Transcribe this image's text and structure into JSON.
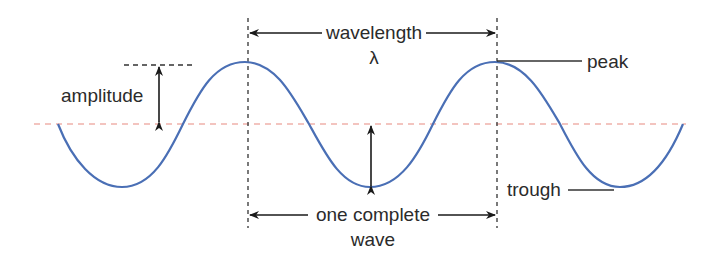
{
  "diagram": {
    "labels": {
      "wavelength": "wavelength",
      "lambda": "λ",
      "amplitude": "amplitude",
      "peak": "peak",
      "trough": "trough",
      "one_complete": "one complete",
      "wave": "wave"
    },
    "colors": {
      "wave": "#4a6fb5",
      "midline": "#e88a80",
      "annotation": "#1a1a1a",
      "guide": "#333333",
      "text": "#2b2b2b",
      "background": "#ffffff"
    },
    "geometry": {
      "midline_y": 124,
      "peak_y": 62,
      "trough_y": 187,
      "wave_start_x": 58,
      "wave_end_x": 683,
      "peaks_x": [
        245,
        495
      ],
      "troughs_x": [
        122,
        370,
        620
      ],
      "wavelength_markers_x": [
        248,
        497
      ]
    }
  }
}
